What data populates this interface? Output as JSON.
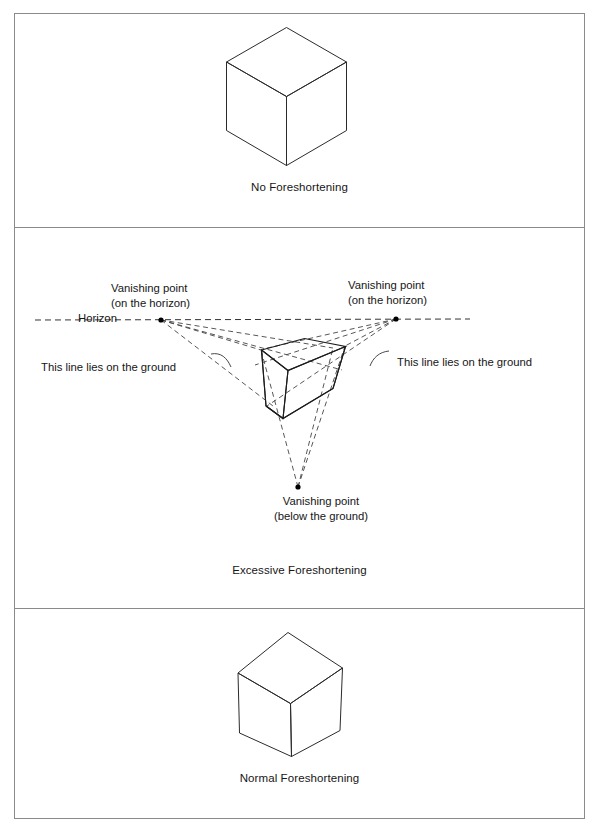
{
  "figure": {
    "panels": [
      {
        "id": "no-foreshortening",
        "caption": "No Foreshortening",
        "cube": {
          "type": "isometric-cube",
          "description": "Cube drawn with parallel edges, no perspective convergence"
        }
      },
      {
        "id": "excessive-foreshortening",
        "caption": "Excessive Foreshortening",
        "cube": {
          "type": "three-point-perspective-cube",
          "description": "Cube drawn with edges converging to three vanishing points"
        },
        "labels": {
          "vanishing_point_left_line1": "Vanishing point",
          "vanishing_point_left_line2": "(on the horizon)",
          "vanishing_point_right_line1": "Vanishing point",
          "vanishing_point_right_line2": "(on the horizon)",
          "horizon": "Horizon",
          "ground_left": "This line lies on the ground",
          "ground_right": "This line lies on the ground",
          "vanishing_point_bottom_line1": "Vanishing point",
          "vanishing_point_bottom_line2": "(below the ground)"
        },
        "vanishing_points": [
          {
            "name": "left-vp",
            "x": 146,
            "y": 92,
            "on": "horizon"
          },
          {
            "name": "right-vp",
            "x": 381,
            "y": 91,
            "on": "horizon"
          },
          {
            "name": "bottom-vp",
            "x": 283,
            "y": 259,
            "on": "below-ground"
          }
        ],
        "horizon_line": {
          "y": 92,
          "x_start": 20,
          "x_end": 455,
          "style": "dashed"
        }
      },
      {
        "id": "normal-foreshortening",
        "caption": "Normal Foreshortening",
        "cube": {
          "type": "two-point-perspective-cube",
          "description": "Cube drawn with mild perspective convergence"
        }
      }
    ],
    "colors": {
      "border": "#8a8a8a",
      "stroke": "#222222",
      "dashed_stroke": "#333333",
      "background": "#ffffff",
      "text": "#161616"
    }
  }
}
